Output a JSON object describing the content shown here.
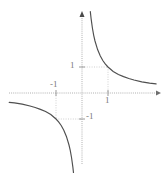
{
  "figure": {
    "background_color": "#ffffff",
    "curve_color": "#4f4f4f",
    "axis_color": "#a8a8a8",
    "grid_color": "#cfcfcf",
    "label_color": "#7a7a7a"
  },
  "labels": {
    "y_positive": "1",
    "y_negative": "-1",
    "x_negative": "-1",
    "x_positive": "1"
  },
  "chart_data": {
    "type": "line",
    "title": "",
    "xlabel": "",
    "ylabel": "",
    "function": "y = 1/x",
    "grid": true,
    "legend": null,
    "xlim": [
      -2.8,
      2.9
    ],
    "ylim": [
      -3.1,
      3.1
    ],
    "xticks": [
      -1,
      1
    ],
    "xtick_labels": [
      "-1",
      "1"
    ],
    "yticks": [
      -1,
      1
    ],
    "ytick_labels": [
      "1",
      "-1"
    ],
    "gridlines": {
      "vertical": [
        -1,
        1
      ],
      "horizontal": [
        -1,
        1
      ],
      "style": "dotted"
    },
    "annotations": [
      {
        "point": [
          1,
          1
        ],
        "label": ""
      },
      {
        "point": [
          -1,
          -1
        ],
        "label": ""
      }
    ],
    "series": [
      {
        "name": "branch-positive",
        "x": [
          0.32,
          0.35,
          0.4,
          0.45,
          0.5,
          0.6,
          0.7,
          0.8,
          0.9,
          1.0,
          1.2,
          1.4,
          1.6,
          1.8,
          2.0,
          2.3,
          2.6,
          2.85
        ],
        "y": [
          3.13,
          2.86,
          2.5,
          2.22,
          2.0,
          1.67,
          1.43,
          1.25,
          1.11,
          1.0,
          0.83,
          0.71,
          0.63,
          0.56,
          0.5,
          0.43,
          0.38,
          0.35
        ]
      },
      {
        "name": "branch-negative",
        "x": [
          -2.8,
          -2.6,
          -2.3,
          -2.0,
          -1.8,
          -1.6,
          -1.4,
          -1.2,
          -1.0,
          -0.9,
          -0.8,
          -0.7,
          -0.6,
          -0.5,
          -0.45,
          -0.4,
          -0.35,
          -0.32
        ],
        "y": [
          -0.36,
          -0.38,
          -0.43,
          -0.5,
          -0.56,
          -0.63,
          -0.71,
          -0.83,
          -1.0,
          -1.11,
          -1.25,
          -1.43,
          -1.67,
          -2.0,
          -2.22,
          -2.5,
          -2.86,
          -3.13
        ]
      }
    ]
  }
}
